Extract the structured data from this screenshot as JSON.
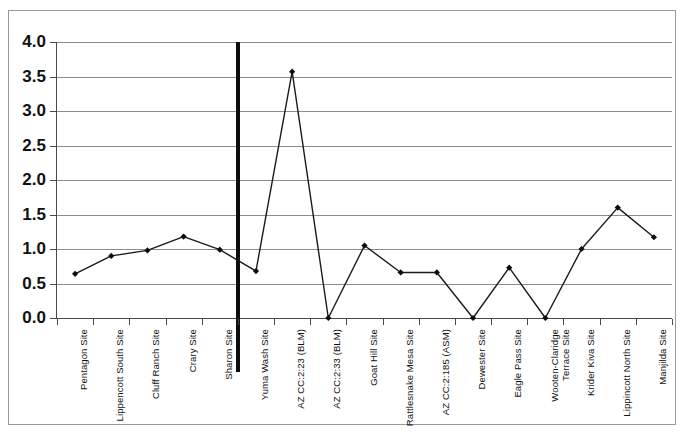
{
  "chart_data": {
    "type": "line",
    "title": "",
    "subtitle": "",
    "xlabel": "",
    "ylabel": "",
    "ylim": [
      0.0,
      4.0
    ],
    "ytick_interval": 0.5,
    "ytick_labels": [
      "4.0",
      "3.5",
      "3.0",
      "2.5",
      "2.0",
      "1.5",
      "1.0",
      "0.5",
      "0.0"
    ],
    "ytick_values": [
      4.0,
      3.5,
      3.0,
      2.5,
      2.0,
      1.5,
      1.0,
      0.5,
      0.0
    ],
    "grid": true,
    "legend": "none",
    "marker": "diamond",
    "line_color": "#1a1a1a",
    "marker_color": "#0d0d0d",
    "grid_color": "#8c8c8c",
    "axis_color": "#4a4a4a",
    "divider_color": "#0d0d0d",
    "divider_after_category": "Sharon Site",
    "categories": [
      "Pentagon Site",
      "Lippencott South Site",
      "Cluff Ranch Site",
      "Crary Site",
      "Sharon Site",
      "Yuma Wash Site",
      "AZ CC:2:23 (BLM)",
      "AZ CC:2:33 (BLM)",
      "Goat Hill Site",
      "Rattlesnake Mesa Site",
      "AZ CC:2:185 (ASM)",
      "Dewester Site",
      "Eagle Pass Site",
      "Wooten-Claridge\nTerrace Site",
      "Krider Kiva Site",
      "Lippincott North Site",
      "Manjilda Site"
    ],
    "values": [
      0.64,
      0.9,
      0.98,
      1.18,
      0.99,
      0.68,
      3.57,
      0.0,
      1.05,
      0.66,
      0.66,
      0.0,
      0.73,
      0.0,
      1.0,
      1.6,
      1.17
    ]
  }
}
